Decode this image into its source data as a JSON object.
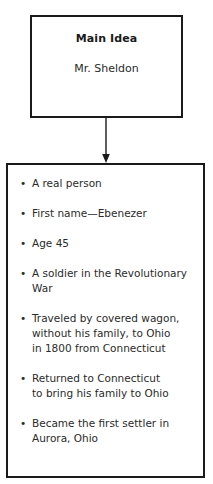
{
  "diagram": {
    "type": "main-idea-and-details-graphic-organizer",
    "main_idea": {
      "title": "Main Idea",
      "subject": "Mr. Sheldon"
    },
    "connector": {
      "icon": "down-arrow-icon",
      "color": "#1a1a1a"
    },
    "details": {
      "items": [
        {
          "bullet": "•",
          "text": "A real person"
        },
        {
          "bullet": "•",
          "text": "First name—Ebenezer"
        },
        {
          "bullet": "•",
          "text": "Age 45"
        },
        {
          "bullet": "•",
          "text": "A soldier in the Revolutionary\nWar"
        },
        {
          "bullet": "•",
          "text": "Traveled by covered wagon,\nwithout his family, to Ohio\nin 1800 from Connecticut"
        },
        {
          "bullet": "•",
          "text": "Returned to Connecticut\nto bring his family to Ohio"
        },
        {
          "bullet": "•",
          "text": "Became the first settler in\nAurora, Ohio"
        }
      ]
    }
  },
  "colors": {
    "border": "#1a1a1a",
    "text": "#2b2b2b",
    "heading": "#1a1a1a",
    "background": "#ffffff"
  }
}
